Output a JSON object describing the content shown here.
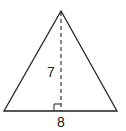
{
  "figure": {
    "shape": "isosceles triangle",
    "height_label": "7",
    "base_label": "8",
    "colors": {
      "stroke": "#222222",
      "background": "#ffffff"
    }
  }
}
